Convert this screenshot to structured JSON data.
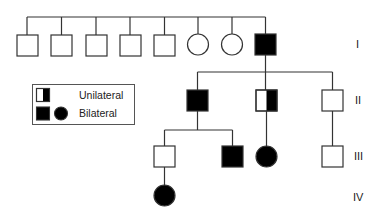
{
  "diagram": {
    "type": "pedigree",
    "generations": [
      {
        "label": "I",
        "members": [
          {
            "sex": "male",
            "status": "unaffected"
          },
          {
            "sex": "male",
            "status": "unaffected"
          },
          {
            "sex": "male",
            "status": "unaffected"
          },
          {
            "sex": "male",
            "status": "unaffected"
          },
          {
            "sex": "male",
            "status": "unaffected"
          },
          {
            "sex": "female",
            "status": "unaffected"
          },
          {
            "sex": "female",
            "status": "unaffected"
          },
          {
            "sex": "male",
            "status": "bilateral"
          }
        ]
      },
      {
        "label": "II",
        "members": [
          {
            "sex": "male",
            "status": "bilateral"
          },
          {
            "sex": "male",
            "status": "unilateral"
          },
          {
            "sex": "male",
            "status": "unaffected"
          }
        ]
      },
      {
        "label": "III",
        "members": [
          {
            "sex": "male",
            "status": "unaffected"
          },
          {
            "sex": "male",
            "status": "bilateral"
          },
          {
            "sex": "female",
            "status": "bilateral"
          },
          {
            "sex": "male",
            "status": "unaffected"
          }
        ]
      },
      {
        "label": "IV",
        "members": [
          {
            "sex": "female",
            "status": "bilateral"
          }
        ]
      }
    ],
    "legend": {
      "unilateral": "Unilateral",
      "bilateral": "Bilateral"
    },
    "colors": {
      "line": "#333333",
      "fill": "#000000"
    }
  }
}
